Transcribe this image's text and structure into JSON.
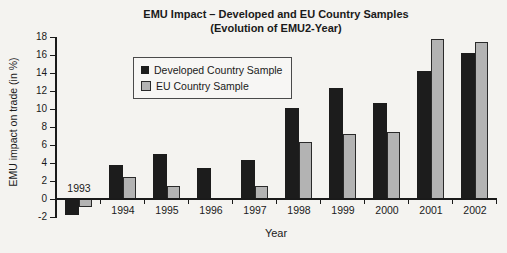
{
  "figure": {
    "title_line1": "EMU Impact – Developed and EU Country Samples",
    "title_line2": "(Evolution of EMU2-Year)"
  },
  "chart_data": {
    "type": "bar",
    "title": "EMU Impact – Developed and EU Country Samples (Evolution of EMU2-Year)",
    "xlabel": "Year",
    "ylabel": "EMU impact on trade (in %)",
    "categories": [
      "1993",
      "1994",
      "1995",
      "1996",
      "1997",
      "1998",
      "1999",
      "2000",
      "2001",
      "2002"
    ],
    "series": [
      {
        "name": "Developed Country Sample",
        "color": "#1c1c1c",
        "values": [
          -1.8,
          3.8,
          5.0,
          3.5,
          4.3,
          10.1,
          12.3,
          10.7,
          14.2,
          16.2
        ]
      },
      {
        "name": "EU Country Sample",
        "color": "#b3b3b3",
        "values": [
          -0.9,
          2.4,
          1.4,
          0,
          1.5,
          6.3,
          7.2,
          7.5,
          17.8,
          17.4
        ]
      }
    ],
    "ylim": [
      -2,
      18
    ],
    "yticks": [
      -2,
      0,
      2,
      4,
      6,
      8,
      10,
      12,
      14,
      16,
      18
    ],
    "grid": false,
    "legend_position": "upper-left"
  },
  "colors": {
    "background": "#f4f3f0",
    "axis": "#1a1a1a",
    "text": "#1a1a1a",
    "bar_border": "#2a2a2a"
  }
}
